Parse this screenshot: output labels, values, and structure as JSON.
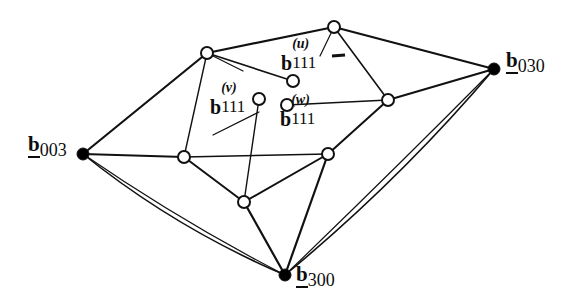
{
  "figure": {
    "background_color": "#ffffff",
    "line_color": "#111111",
    "node_fill_open": "#ffffff",
    "node_fill_solid": "#000000",
    "width": 575,
    "height": 306
  },
  "labels": {
    "b003": {
      "base": "b",
      "sub": "003",
      "x": 28,
      "y": 135
    },
    "b030": {
      "base": "b",
      "sub": "030",
      "x": 506,
      "y": 51
    },
    "b300": {
      "base": "b",
      "sub": "300",
      "x": 296,
      "y": 265
    },
    "b111u": {
      "base": "b",
      "sup": "(u)",
      "sub": "111",
      "x": 281,
      "y": 48
    },
    "b111v": {
      "base": "b",
      "sup": "(v)",
      "sub": "111",
      "x": 210,
      "y": 92
    },
    "b111w": {
      "base": "b",
      "sup": "(w)",
      "sub": "111",
      "x": 280,
      "y": 104
    }
  },
  "nodes": {
    "solid": [
      {
        "name": "b003",
        "x": 83,
        "y": 154,
        "r": 6
      },
      {
        "name": "b030",
        "x": 494,
        "y": 69,
        "r": 6
      },
      {
        "name": "b300",
        "x": 285,
        "y": 275,
        "r": 6
      }
    ],
    "open": [
      {
        "name": "top-apex",
        "x": 334,
        "y": 27,
        "r": 6
      },
      {
        "name": "upper-left",
        "x": 207,
        "y": 53,
        "r": 6
      },
      {
        "name": "b111u-node",
        "x": 293,
        "y": 81,
        "r": 6
      },
      {
        "name": "b111v-node",
        "x": 259,
        "y": 99,
        "r": 6
      },
      {
        "name": "b111w-node",
        "x": 287,
        "y": 105,
        "r": 6
      },
      {
        "name": "right-mid",
        "x": 388,
        "y": 100,
        "r": 6
      },
      {
        "name": "left-mid",
        "x": 184,
        "y": 157,
        "r": 6
      },
      {
        "name": "right-low",
        "x": 328,
        "y": 154,
        "r": 6
      },
      {
        "name": "bottom-mid",
        "x": 244,
        "y": 202,
        "r": 6
      }
    ]
  },
  "edges": {
    "straight": [
      {
        "from": "b003",
        "to": "upper-left",
        "x1": 83,
        "y1": 154,
        "x2": 207,
        "y2": 53,
        "w": 2.2
      },
      {
        "from": "b003",
        "to": "left-mid",
        "x1": 83,
        "y1": 154,
        "x2": 184,
        "y2": 157,
        "w": 2.2
      },
      {
        "from": "upper-left",
        "to": "top-apex",
        "x1": 207,
        "y1": 53,
        "x2": 334,
        "y2": 27,
        "w": 2.2
      },
      {
        "from": "upper-left",
        "to": "b111u-node",
        "x1": 207,
        "y1": 53,
        "x2": 293,
        "y2": 81,
        "w": 1.6
      },
      {
        "from": "upper-left",
        "to": "left-mid",
        "x1": 207,
        "y1": 53,
        "x2": 184,
        "y2": 157,
        "w": 1.4
      },
      {
        "from": "top-apex",
        "to": "b030",
        "x1": 334,
        "y1": 27,
        "x2": 494,
        "y2": 69,
        "w": 2.2
      },
      {
        "from": "top-apex",
        "to": "right-mid",
        "x1": 334,
        "y1": 27,
        "x2": 388,
        "y2": 100,
        "w": 1.6
      },
      {
        "from": "right-mid",
        "to": "b030",
        "x1": 388,
        "y1": 100,
        "x2": 494,
        "y2": 69,
        "w": 2.0
      },
      {
        "from": "b111w-node",
        "to": "right-mid",
        "x1": 287,
        "y1": 105,
        "x2": 388,
        "y2": 100,
        "w": 1.4
      },
      {
        "from": "right-mid",
        "to": "right-low",
        "x1": 388,
        "y1": 100,
        "x2": 328,
        "y2": 154,
        "w": 2.0
      },
      {
        "from": "left-mid",
        "to": "bottom-mid",
        "x1": 184,
        "y1": 157,
        "x2": 244,
        "y2": 202,
        "w": 2.0
      },
      {
        "from": "b111v-node",
        "to": "bottom-mid",
        "x1": 259,
        "y1": 99,
        "x2": 244,
        "y2": 202,
        "w": 1.4
      },
      {
        "from": "left-mid",
        "to": "right-low",
        "x1": 184,
        "y1": 157,
        "x2": 328,
        "y2": 154,
        "w": 1.4
      },
      {
        "from": "bottom-mid",
        "to": "right-low",
        "x1": 244,
        "y1": 202,
        "x2": 328,
        "y2": 154,
        "w": 2.0
      },
      {
        "from": "bottom-mid",
        "to": "b300",
        "x1": 244,
        "y1": 202,
        "x2": 285,
        "y2": 275,
        "w": 2.2
      },
      {
        "from": "right-low",
        "to": "b300",
        "x1": 328,
        "y1": 154,
        "x2": 285,
        "y2": 275,
        "w": 2.2
      }
    ],
    "leaders": [
      {
        "name": "leader-b111u",
        "x1": 334,
        "y1": 27,
        "x2": 320,
        "y2": 56,
        "w": 1.2
      },
      {
        "name": "leader-b111v",
        "x1": 259,
        "y1": 112,
        "x2": 213,
        "y2": 135,
        "w": 1.2
      },
      {
        "name": "leader-upper-left",
        "x1": 207,
        "y1": 53,
        "x2": 243,
        "y2": 71,
        "w": 1.2
      }
    ],
    "curved": [
      {
        "name": "boundary-b003-b300",
        "d": "M 83 154 Q 175 228 285 275",
        "w": 1.6
      },
      {
        "name": "boundary-b030-b300",
        "d": "M 494 69 Q 400 180 285 275",
        "w": 1.6
      },
      {
        "name": "inner-b003-b300",
        "d": "M 83 154 Q 182 222 285 275",
        "w": 1.2
      },
      {
        "name": "inner-b030-b300",
        "d": "M 494 69 Q 393 171 285 275",
        "w": 1.2
      }
    ]
  }
}
